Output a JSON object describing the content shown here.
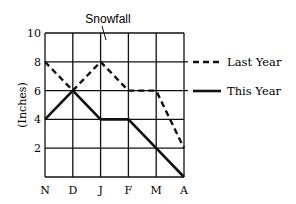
{
  "chart_data": {
    "type": "line",
    "title": "Snowfall",
    "xlabel": "",
    "ylabel": "(Inches)",
    "categories": [
      "N",
      "D",
      "J",
      "F",
      "M",
      "A"
    ],
    "ylim": [
      0,
      10
    ],
    "yticks": [
      "2",
      "4",
      "6",
      "8",
      "10"
    ],
    "grid": true,
    "legend_position": "right",
    "series": [
      {
        "name": "Last Year",
        "style": "dashed",
        "values": [
          8,
          6,
          8,
          6,
          6,
          2
        ]
      },
      {
        "name": "This Year",
        "style": "solid",
        "values": [
          4,
          6,
          4,
          4,
          2,
          0
        ]
      }
    ]
  },
  "colors": {
    "line": "#111111",
    "grid": "#111111",
    "background": "#ffffff"
  }
}
